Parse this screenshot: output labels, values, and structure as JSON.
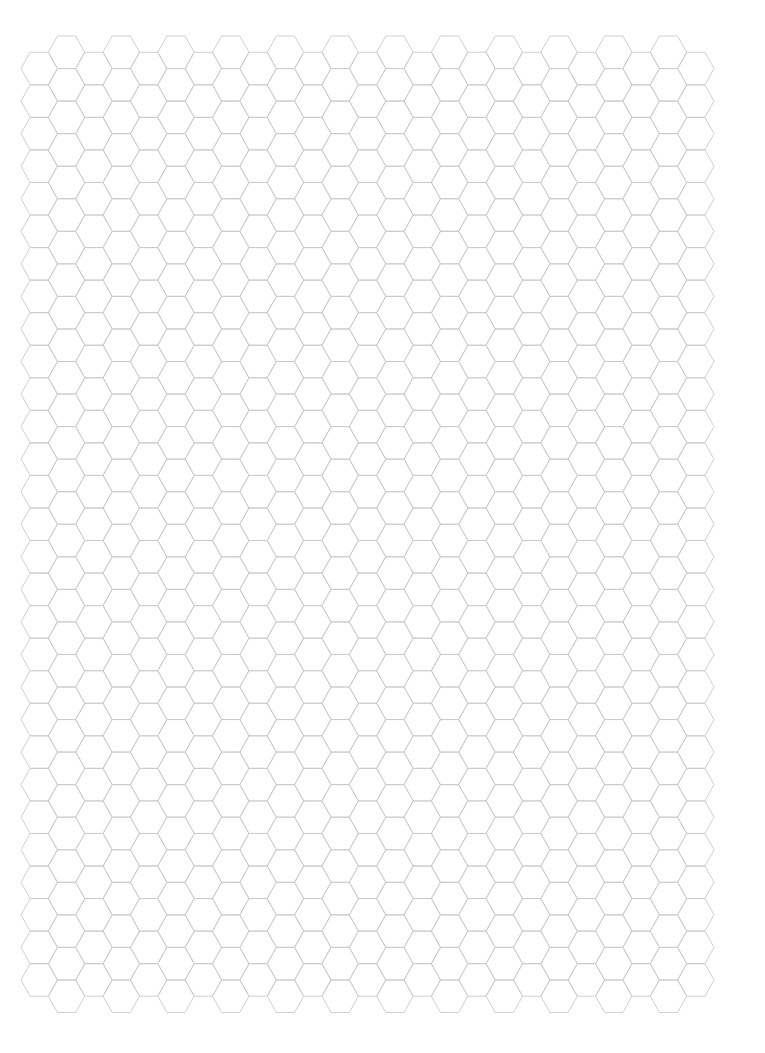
{
  "page": {
    "kind": "hexagonal graph paper",
    "width": 765,
    "height": 1053,
    "background": "#ffffff"
  },
  "hex_grid": {
    "orientation": "flat-top",
    "line_color": "#c9c9c9",
    "line_width": 0.9,
    "hex_radius": 18.2,
    "hex_half_height": 16.27,
    "column_spacing": 27.36,
    "row_pitch": 32.55,
    "first_column_center_x": 39.2,
    "columns": 25,
    "high_column_top_y": 36.0,
    "high_column_rows": 30,
    "low_column_rows": 29,
    "first_column_is_low": true
  }
}
